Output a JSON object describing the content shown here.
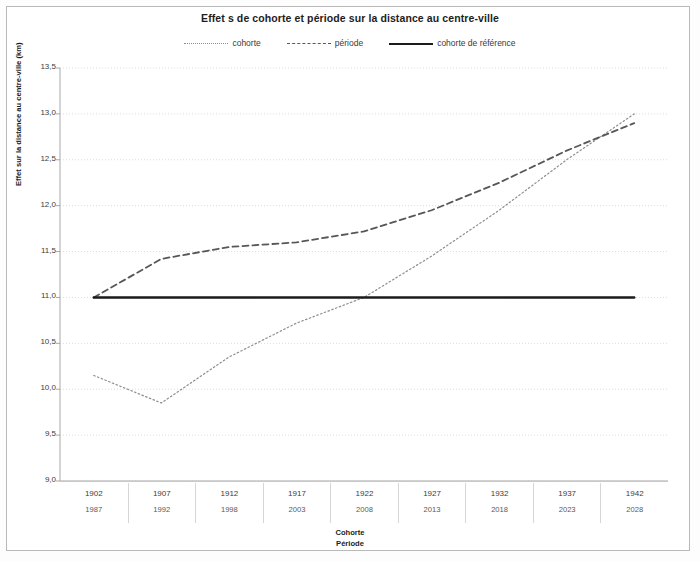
{
  "chart_data": {
    "type": "line",
    "title": "Effet s de cohorte et période sur la distance au centre-ville",
    "xlabel_primary": "Cohorte",
    "xlabel_secondary": "Période",
    "ylabel": "Effet sur la distance au centre-ville (km)",
    "ylim": [
      9.0,
      13.5
    ],
    "ytick_labels": [
      "13,5",
      "13,0",
      "12,5",
      "12,0",
      "11,5",
      "11,0",
      "10,5",
      "10,0",
      "9,5",
      "9,0"
    ],
    "ytick_values": [
      13.5,
      13.0,
      12.5,
      12.0,
      11.5,
      11.0,
      10.5,
      10.0,
      9.5,
      9.0
    ],
    "grid": true,
    "legend_position": "top",
    "categories_cohorte": [
      "1902",
      "1907",
      "1912",
      "1917",
      "1922",
      "1927",
      "1932",
      "1937",
      "1942"
    ],
    "categories_periode": [
      "1987",
      "1992",
      "1998",
      "2003",
      "2008",
      "2013",
      "2018",
      "2023",
      "2028"
    ],
    "x_values": [
      1902,
      1907,
      1912,
      1917,
      1922,
      1927,
      1932,
      1937,
      1942
    ],
    "series": [
      {
        "name": "cohorte",
        "style": "dotted",
        "color": "#8d8d8d",
        "values": [
          10.15,
          9.85,
          10.35,
          10.72,
          11.0,
          11.45,
          11.95,
          12.5,
          13.0
        ]
      },
      {
        "name": "période",
        "style": "dashed",
        "color": "#575757",
        "values": [
          11.0,
          11.42,
          11.55,
          11.6,
          11.72,
          11.95,
          12.25,
          12.6,
          12.9
        ]
      },
      {
        "name": "cohorte de référence",
        "style": "solid",
        "color": "#1b1b1b",
        "values": [
          11.0,
          11.0,
          11.0,
          11.0,
          11.0,
          11.0,
          11.0,
          11.0,
          11.0
        ]
      }
    ]
  },
  "legend": {
    "items": [
      {
        "label": "cohorte"
      },
      {
        "label": "période"
      },
      {
        "label": "cohorte de référence"
      }
    ]
  },
  "axes": {
    "x_title_line1": "Cohorte",
    "x_title_line2": "Période"
  },
  "colors": {
    "cohorte": "#8d8d8d",
    "periode": "#575757",
    "reference": "#1b1b1b",
    "grid": "#dcdcdc",
    "frame": "#b9b9b9"
  }
}
